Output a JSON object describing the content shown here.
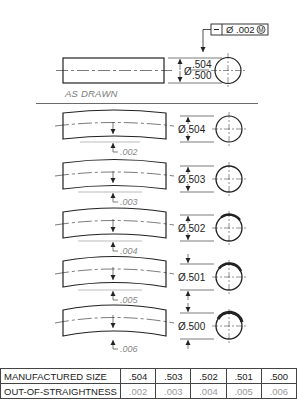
{
  "feature_control_frame": {
    "symbol": "—",
    "tolerance": "Ø .002",
    "modifier": "Ⓜ"
  },
  "as_drawn": {
    "label": "AS DRAWN",
    "diameter_symbol": "Ø",
    "upper_limit": ".504",
    "lower_limit": ".500"
  },
  "parts": [
    {
      "size": "Ø.504",
      "deviation": ".002"
    },
    {
      "size": "Ø.503",
      "deviation": ".003"
    },
    {
      "size": "Ø.502",
      "deviation": ".004"
    },
    {
      "size": "Ø.501",
      "deviation": ".005"
    },
    {
      "size": "Ø.500",
      "deviation": ".006"
    }
  ],
  "table": {
    "rows": [
      {
        "header": "MANUFACTURED SIZE",
        "values": [
          ".504",
          ".503",
          ".502",
          ".501",
          ".500"
        ]
      },
      {
        "header": "OUT-OF-STRAIGHTNESS",
        "values": [
          ".002",
          ".003",
          ".004",
          ".005",
          ".006"
        ]
      }
    ]
  }
}
